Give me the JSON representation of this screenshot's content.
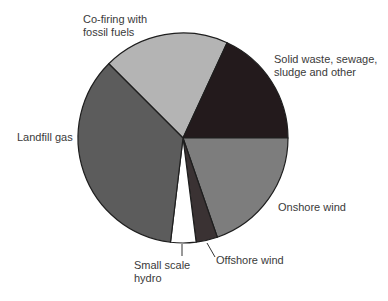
{
  "chart_data": {
    "type": "pie",
    "title": "",
    "start_angle_deg": -45,
    "direction": "clockwise",
    "center": [
      183,
      138
    ],
    "radius": 105,
    "slices": [
      {
        "label": "Co-firing with fossil fuels",
        "value": 19.4,
        "color": "#b4b4b4"
      },
      {
        "label": "Solid waste, sewage, sludge and other",
        "value": 18.1,
        "color": "#231a1c"
      },
      {
        "label": "Onshore wind",
        "value": 19.7,
        "color": "#7d7d7d"
      },
      {
        "label": "Offshore wind",
        "value": 3.3,
        "color": "#3a3233"
      },
      {
        "label": "Small scale hydro",
        "value": 3.9,
        "color": "#ffffff"
      },
      {
        "label": "Landfill gas",
        "value": 35.6,
        "color": "#5c5c5c"
      }
    ],
    "legend": "none (direct labels)"
  },
  "labels": {
    "cofiring_l1": "Co-firing with",
    "cofiring_l2": "fossil fuels",
    "solid_l1": "Solid waste, sewage,",
    "solid_l2": "sludge and other",
    "landfill": "Landfill gas",
    "onshore": "Onshore wind",
    "offshore": "Offshore wind",
    "hydro_l1": "Small scale",
    "hydro_l2": "hydro"
  }
}
